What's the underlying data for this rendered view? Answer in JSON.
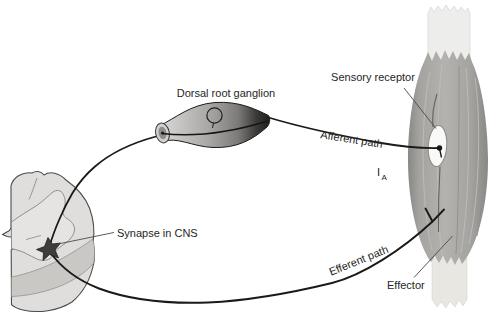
{
  "labels": {
    "dorsal_root_ganglion": "Dorsal root ganglion",
    "sensory_receptor": "Sensory receptor",
    "afferent_path": "Afferent path",
    "ia_main": "I",
    "ia_sub": "A",
    "synapse_in_cns": "Synapse in CNS",
    "efferent_path": "Efferent path",
    "effector": "Effector"
  },
  "colors": {
    "background": "#ffffff",
    "nerve_line": "#1b1a18",
    "label_text": "#262624",
    "pointer_line": "#4a4947",
    "muscle_light": "#b4b2af",
    "muscle_mid": "#a5a3a0",
    "muscle_dark": "#8a8886",
    "muscle_striation": "#bfbdba",
    "muscle_striation_dark": "#918f8c",
    "tendon": "#ededeb",
    "tendon_lower": "#e9e7e1",
    "ganglion_light": "#dcdbd9",
    "ganglion_mid": "#a9a8a6",
    "ganglion_shadow": "#7b7a78",
    "ganglion_deep": "#3b3a38",
    "ganglion_dark": "#1f1f1d",
    "cord_face": "#dfdedc",
    "cord_inner": "#e5e4e2",
    "cord_side": "#c9c8c5",
    "cord_outline": "#4d4c4a",
    "gray_matter_line": "#8f8e8b",
    "receptor_fill": "#f9f9f7",
    "receptor_outline": "#8a8884",
    "synapse": "#3e3d3a"
  }
}
